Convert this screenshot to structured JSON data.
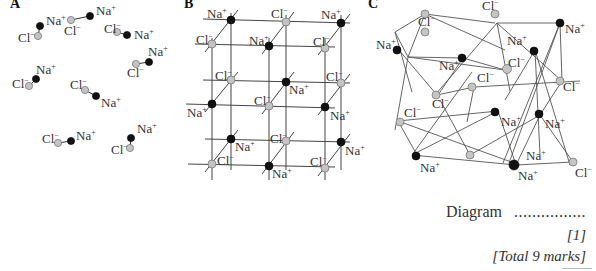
{
  "panels": {
    "A": {
      "label": "A",
      "description": "Separate Na+ Cl- ion pairs (molecules)"
    },
    "B": {
      "label": "B",
      "description": "Regular cubic lattice of alternating Na+ and Cl- ions"
    },
    "C": {
      "label": "C",
      "description": "Irregular disordered network of Na+ and Cl- ions"
    }
  },
  "ions": {
    "na": {
      "symbol": "Na",
      "charge": "+",
      "color": "#111111"
    },
    "cl": {
      "symbol": "Cl",
      "charge": "−",
      "color": "#c4c4c4"
    }
  },
  "answer_line": {
    "label": "Diagram",
    "dots": "................"
  },
  "mark": "[1]",
  "total": "[Total 9 marks]"
}
